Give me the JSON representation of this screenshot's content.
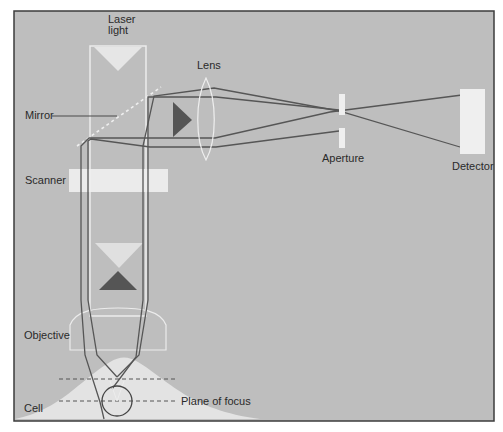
{
  "diagram": {
    "type": "confocal-microscope-schematic",
    "background_color": "#bdbdbd",
    "frame_color": "#3a3a3a",
    "beam_color": "#555555",
    "component_color": "#eeeeee",
    "labels": {
      "laser_light": [
        "Laser",
        "light"
      ],
      "lens": "Lens",
      "mirror": "Mirror",
      "scanner": "Scanner",
      "aperture": "Aperture",
      "detector": "Detector",
      "objective": "Objective",
      "cell": "Cell",
      "plane_of_focus": "Plane of focus"
    }
  }
}
